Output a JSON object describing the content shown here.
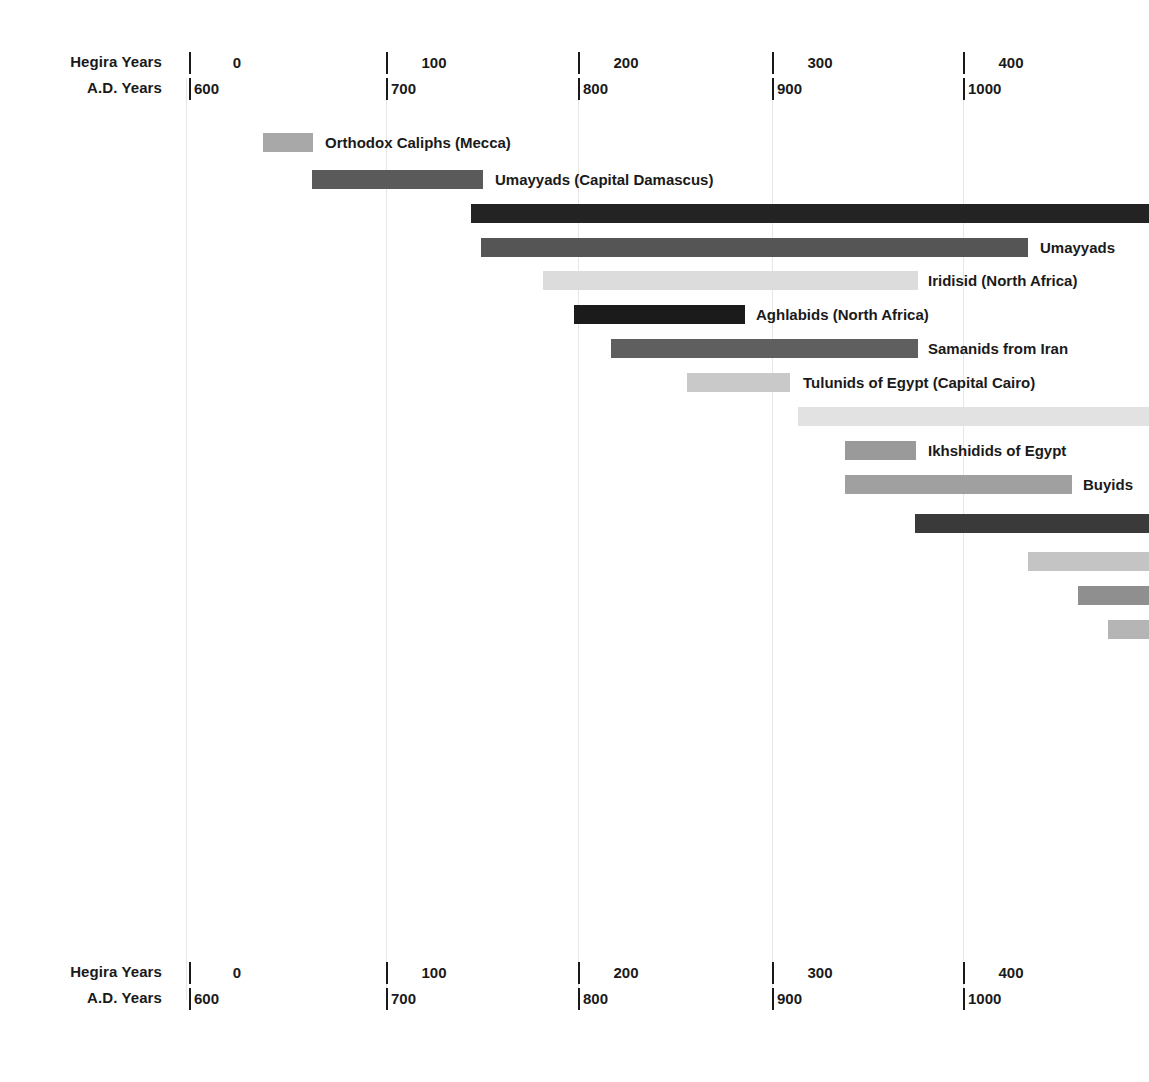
{
  "axis": {
    "hegira_caption": "Hegira Years",
    "ad_caption": "A.D. Years",
    "hegira_ticks": [
      "0",
      "100",
      "200",
      "300",
      "400"
    ],
    "ad_ticks": [
      "600",
      "700",
      "800",
      "900",
      "1000"
    ],
    "ad_start": 600,
    "ad_end": 1096,
    "px_per_year": 1.9275,
    "origin_px": 189
  },
  "colors": {
    "black": "#1f1f1f",
    "near_black": "#2b2b2b",
    "dark_gray": "#4f4f4f",
    "gray": "#6e6e6e",
    "mid_gray": "#8d8d8d",
    "light_gray": "#a8a8a8",
    "pale_gray": "#c9c9c9",
    "very_pale": "#dcdcdc",
    "gridline": "#e6e6e6",
    "text": "#1a1a1a",
    "background": "#ffffff"
  },
  "chart_data": {
    "type": "bar",
    "title": "",
    "xlabel": "Hegira Years / A.D. Years",
    "ylabel": "",
    "orientation": "horizontal-timeline",
    "grid": true,
    "legend": "none",
    "xlim_ad": [
      600,
      1096
    ],
    "hegira_tick_values": [
      0,
      100,
      200,
      300,
      400
    ],
    "ad_tick_values": [
      600,
      700,
      800,
      900,
      1000
    ],
    "bars": [
      {
        "label": "Orthodox Caliphs (Mecca)",
        "start_ad": 638,
        "end_ad": 664,
        "x_px": 263,
        "w_px": 50,
        "y_px": 133,
        "color": "#a8a8a8",
        "label_x_px": 325
      },
      {
        "label": "Umayyads (Capital Damascus)",
        "start_ad": 664,
        "end_ad": 752,
        "x_px": 312,
        "w_px": 171,
        "y_px": 170,
        "color": "#5a5a5a",
        "label_x_px": 495
      },
      {
        "label": "",
        "start_ad": 746,
        "end_ad": 1096,
        "x_px": 471,
        "w_px": 678,
        "y_px": 204,
        "color": "#232323",
        "label_x_px": 0
      },
      {
        "label": "Umayyads",
        "start_ad": 752,
        "end_ad": 1035,
        "x_px": 481,
        "w_px": 547,
        "y_px": 238,
        "color": "#555555",
        "label_x_px": 1040
      },
      {
        "label": "Iridisid (North Africa)",
        "start_ad": 783,
        "end_ad": 978,
        "x_px": 543,
        "w_px": 375,
        "y_px": 271,
        "color": "#dcdcdc",
        "label_x_px": 928
      },
      {
        "label": "Aghlabids (North Africa)",
        "start_ad": 793,
        "end_ad": 888,
        "x_px": 574,
        "w_px": 171,
        "y_px": 305,
        "color": "#1b1b1b",
        "label_x_px": 756
      },
      {
        "label": "Samanids from Iran",
        "start_ad": 819,
        "end_ad": 978,
        "x_px": 611,
        "w_px": 307,
        "y_px": 339,
        "color": "#5f5f5f",
        "label_x_px": 928
      },
      {
        "label": "Tulunids of Egypt (Capital Cairo)",
        "start_ad": 858,
        "end_ad": 911,
        "x_px": 687,
        "w_px": 103,
        "y_px": 373,
        "color": "#c9c9c9",
        "label_x_px": 803
      },
      {
        "label": "",
        "start_ad": 914,
        "end_ad": 1096,
        "x_px": 798,
        "w_px": 351,
        "y_px": 407,
        "color": "#e2e2e2",
        "label_x_px": 0
      },
      {
        "label": "Ikhshidids of Egypt",
        "start_ad": 938,
        "end_ad": 975,
        "x_px": 845,
        "w_px": 71,
        "y_px": 441,
        "color": "#9a9a9a",
        "label_x_px": 928
      },
      {
        "label": "Buyids",
        "start_ad": 938,
        "end_ad": 1056,
        "x_px": 845,
        "w_px": 227,
        "y_px": 475,
        "color": "#a0a0a0",
        "label_x_px": 1083
      },
      {
        "label": "",
        "start_ad": 975,
        "end_ad": 1096,
        "x_px": 915,
        "w_px": 234,
        "y_px": 514,
        "color": "#3a3a3a",
        "label_x_px": 0
      },
      {
        "label": "",
        "start_ad": 1033,
        "end_ad": 1096,
        "x_px": 1028,
        "w_px": 121,
        "y_px": 552,
        "color": "#c4c4c4",
        "label_x_px": 0
      },
      {
        "label": "",
        "start_ad": 1059,
        "end_ad": 1096,
        "x_px": 1078,
        "w_px": 71,
        "y_px": 586,
        "color": "#8f8f8f",
        "label_x_px": 0
      },
      {
        "label": "",
        "start_ad": 1075,
        "end_ad": 1096,
        "x_px": 1108,
        "w_px": 41,
        "y_px": 620,
        "color": "#b5b5b5",
        "label_x_px": 0
      }
    ]
  },
  "gridlines_px": [
    186,
    386,
    578,
    772,
    963
  ],
  "grid_top_px": 78,
  "grid_bottom_px": 1000,
  "axis_top_y_px": 52,
  "axis_bottom_y_px": 962,
  "tick_px": [
    189,
    386,
    578,
    772,
    963
  ]
}
